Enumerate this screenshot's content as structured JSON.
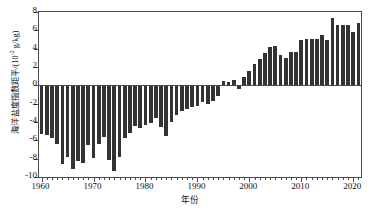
{
  "chart_data": {
    "type": "bar",
    "title": "",
    "xlabel": "年份",
    "ylabel": "海洋盐度指数距平/(10⁻² g/kg)",
    "ylabel_main": "海洋盐度指数距平/(10",
    "ylabel_exp": "-2",
    "ylabel_tail": " g/kg)",
    "xlim": [
      1959.5,
      2021.5
    ],
    "ylim": [
      -10,
      8
    ],
    "grid": false,
    "legend": null,
    "bar_color": "#333333",
    "axis_color": "#4a4a4a",
    "ytick_labels": [
      "8",
      "6",
      "4",
      "2",
      "0",
      "-2",
      "-4",
      "-6",
      "-8",
      "-10"
    ],
    "ytick_values": [
      8,
      6,
      4,
      2,
      0,
      -2,
      -4,
      -6,
      -8,
      -10
    ],
    "xtick_labels": [
      "1960",
      "1970",
      "1980",
      "1990",
      "2000",
      "2010",
      "2020"
    ],
    "xtick_values": [
      1960,
      1970,
      1980,
      1990,
      2000,
      2010,
      2020
    ],
    "x": [
      1960,
      1961,
      1962,
      1963,
      1964,
      1965,
      1966,
      1967,
      1968,
      1969,
      1970,
      1971,
      1972,
      1973,
      1974,
      1975,
      1976,
      1977,
      1978,
      1979,
      1980,
      1981,
      1982,
      1983,
      1984,
      1985,
      1986,
      1987,
      1988,
      1989,
      1990,
      1991,
      1992,
      1993,
      1994,
      1995,
      1996,
      1997,
      1998,
      1999,
      2000,
      2001,
      2002,
      2003,
      2004,
      2005,
      2006,
      2007,
      2008,
      2009,
      2010,
      2011,
      2012,
      2013,
      2014,
      2015,
      2016,
      2017,
      2018,
      2019,
      2020,
      2021
    ],
    "values": [
      -5.3,
      -5.4,
      -5.8,
      -6.4,
      -8.6,
      -7.8,
      -9.1,
      -8.3,
      -8.5,
      -6.5,
      -7.9,
      -6.4,
      -5.6,
      -8.1,
      -9.4,
      -7.8,
      -5.7,
      -5.2,
      -4.4,
      -4.7,
      -4.3,
      -4.1,
      -3.6,
      -4.6,
      -5.5,
      -4.0,
      -3.2,
      -2.8,
      -2.6,
      -2.4,
      -2.3,
      -1.8,
      -2.0,
      -1.7,
      -1.2,
      0.5,
      0.4,
      0.6,
      -0.4,
      0.9,
      1.6,
      2.3,
      2.9,
      3.5,
      4.2,
      4.3,
      3.3,
      3.0,
      3.6,
      3.6,
      4.9,
      5.1,
      5.1,
      5.1,
      5.5,
      4.9,
      7.4,
      6.6,
      6.6,
      6.6,
      5.8,
      6.8
    ]
  }
}
